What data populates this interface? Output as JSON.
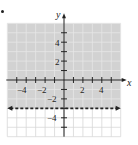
{
  "chart_data": {
    "type": "inequality-graph",
    "title": "",
    "inequality": "y > -3",
    "boundary": {
      "equation": "y = -3",
      "style": "dashed",
      "arrows": "both"
    },
    "shaded_region": "above boundary",
    "xlabel": "x",
    "ylabel": "y",
    "xlim": [
      -6,
      6
    ],
    "ylim": [
      -6,
      6
    ],
    "grid": true,
    "x_tick_labels": [
      "-4",
      "-2",
      "2",
      "4"
    ],
    "y_tick_labels": [
      "4",
      "2",
      "-2",
      "-4"
    ],
    "colors": {
      "shade": "#d2d2d2",
      "grid_shaded": "#e6e6e6",
      "grid_unshaded": "#d8d8d8",
      "axis": "#222222",
      "boundary": "#222222"
    }
  },
  "labels": {
    "x_axis": "x",
    "y_axis": "y",
    "xt": [
      "−4",
      "−2",
      "2",
      "4"
    ],
    "yt": [
      "4",
      "2",
      "−2",
      "−4"
    ]
  }
}
